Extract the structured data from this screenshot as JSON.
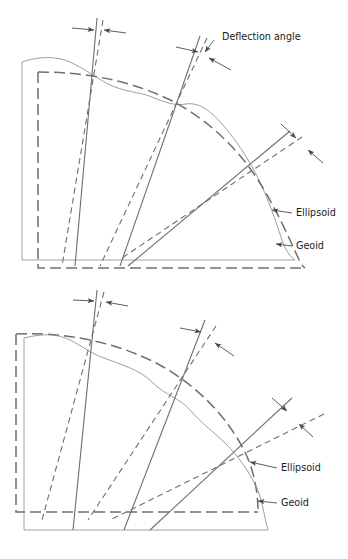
{
  "figure": {
    "type": "technical-line-diagram",
    "background_color": "#ffffff",
    "line_color": "#6b6b6b",
    "surface_line_color": "#8a8a8a",
    "text_color": "#1b1b1b",
    "panels": [
      {
        "id": "upper",
        "name": "upper-diagram",
        "outer_surface": "geoid",
        "inner_surface": "ellipsoid",
        "labels": [
          {
            "key": "deflection_angle",
            "text": "Deflection angle",
            "x": 222,
            "y": 40
          },
          {
            "key": "ellipsoid",
            "text": "Ellipsoid",
            "x": 295,
            "y": 216
          },
          {
            "key": "geoid",
            "text": "Geoid",
            "x": 295,
            "y": 249
          }
        ],
        "angle_markers": [
          {
            "key": "marker-top-left",
            "x": 96,
            "y": 30
          },
          {
            "key": "marker-top-middle",
            "x": 200,
            "y": 52
          },
          {
            "key": "marker-right",
            "x": 300,
            "y": 140
          }
        ],
        "vertical_pairs": [
          {
            "key": "plumb-line-1",
            "kind": "solid",
            "meaning": "plumb-line-geoid-normal"
          },
          {
            "key": "normal-line-1",
            "kind": "dashed",
            "meaning": "ellipsoid-normal"
          },
          {
            "key": "plumb-line-2",
            "kind": "solid",
            "meaning": "plumb-line-geoid-normal"
          },
          {
            "key": "normal-line-2",
            "kind": "dashed",
            "meaning": "ellipsoid-normal"
          },
          {
            "key": "plumb-line-3",
            "kind": "solid",
            "meaning": "plumb-line-geoid-normal"
          },
          {
            "key": "normal-line-3",
            "kind": "dashed",
            "meaning": "ellipsoid-normal"
          }
        ]
      },
      {
        "id": "lower",
        "name": "lower-diagram",
        "outer_surface": "ellipsoid",
        "inner_surface": "geoid",
        "labels": [
          {
            "key": "ellipsoid",
            "text": "Ellipsoid",
            "x": 280,
            "y": 471
          },
          {
            "key": "geoid",
            "text": "Geoid",
            "x": 280,
            "y": 506
          }
        ],
        "angle_markers": [
          {
            "key": "marker-top-left",
            "x": 96,
            "y": 300
          },
          {
            "key": "marker-top-middle",
            "x": 203,
            "y": 330
          },
          {
            "key": "marker-right",
            "x": 290,
            "y": 408
          }
        ],
        "vertical_pairs": [
          {
            "key": "plumb-line-1",
            "kind": "solid",
            "meaning": "plumb-line-geoid-normal"
          },
          {
            "key": "normal-line-1",
            "kind": "dashed",
            "meaning": "ellipsoid-normal"
          },
          {
            "key": "plumb-line-2",
            "kind": "solid",
            "meaning": "plumb-line-geoid-normal"
          },
          {
            "key": "normal-line-2",
            "kind": "dashed",
            "meaning": "ellipsoid-normal"
          },
          {
            "key": "plumb-line-3",
            "kind": "solid",
            "meaning": "plumb-line-geoid-normal"
          },
          {
            "key": "normal-line-3",
            "kind": "dashed",
            "meaning": "ellipsoid-normal"
          }
        ]
      }
    ]
  }
}
